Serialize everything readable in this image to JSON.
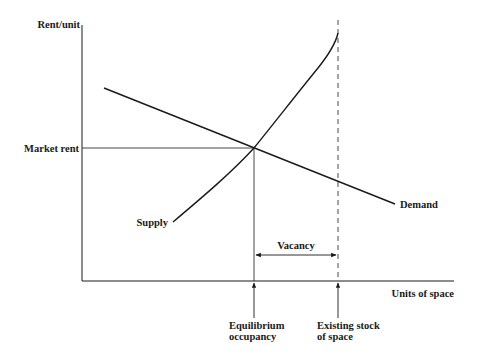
{
  "diagram": {
    "axes": {
      "y_label": "Rent/unit",
      "x_label": "Units of space"
    },
    "labels": {
      "market_rent": "Market rent",
      "supply": "Supply",
      "demand": "Demand",
      "vacancy": "Vacancy",
      "equilibrium_line1": "Equilibrium",
      "equilibrium_line2": "occupancy",
      "stock_line1": "Existing stock",
      "stock_line2": "of space"
    },
    "colors": {
      "line": "#1a1a1a",
      "background": "#ffffff"
    }
  }
}
